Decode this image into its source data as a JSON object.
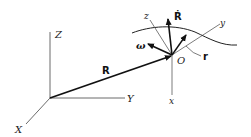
{
  "diagram": {
    "type": "vector-kinematics-figure",
    "global_frame": {
      "axes": [
        "X",
        "Y",
        "Z"
      ],
      "labels": {
        "x": "X",
        "y": "Y",
        "z": "Z"
      }
    },
    "position_vector": {
      "label": "R"
    },
    "moving_frame": {
      "origin_label": "O",
      "axes_labels": {
        "x": "x",
        "y": "y",
        "z": "z"
      }
    },
    "vectors": {
      "velocity_label": "Ṙ",
      "angular_velocity_label": "ω",
      "relative_position_label": "r"
    },
    "colors": {
      "ink": "#111111",
      "thin": "#444444",
      "background": "#ffffff"
    }
  }
}
